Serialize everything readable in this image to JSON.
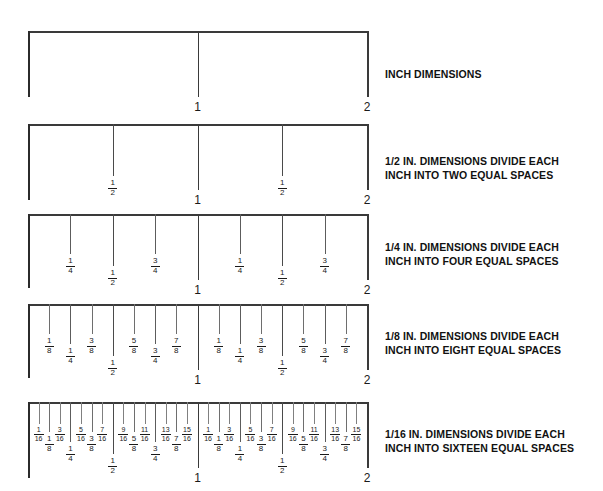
{
  "figure": {
    "background_color": "#ffffff",
    "line_color": "#3a3a3a",
    "text_color": "#1a1a1a"
  },
  "geometry": {
    "origin_x": 28,
    "inch_width": 169.5,
    "inches": 2,
    "rail_y": [
      31,
      124,
      214,
      304,
      402
    ],
    "endcap_bottom": [
      97,
      200,
      288,
      378,
      478
    ],
    "caption_x": 385,
    "caption_y": [
      68,
      155,
      241,
      330,
      428
    ],
    "tick_len": {
      "inch": 66,
      "half": 52,
      "quarter": 40,
      "eighth": 30,
      "sixteenth": 22
    },
    "label_offset": {
      "inch": 4,
      "half": 3,
      "quarter": 3,
      "eighth": 3,
      "sixteenth": 2
    }
  },
  "rulers": [
    {
      "id": "inch",
      "caption": "INCH DIMENSIONS",
      "inch_labels": [
        "1",
        "2"
      ],
      "fractions": []
    },
    {
      "id": "half",
      "caption": "1/2 IN. DIMENSIONS DIVIDE EACH\nINCH INTO TWO EQUAL SPACES",
      "inch_labels": [
        "1",
        "2"
      ],
      "fractions": [
        {
          "pos": 0.5,
          "num": "1",
          "den": "2",
          "tier": "half"
        },
        {
          "pos": 1.5,
          "num": "1",
          "den": "2",
          "tier": "half"
        }
      ]
    },
    {
      "id": "quarter",
      "caption": "1/4 IN. DIMENSIONS DIVIDE EACH\nINCH INTO FOUR EQUAL SPACES",
      "inch_labels": [
        "1",
        "2"
      ],
      "fractions": [
        {
          "pos": 0.25,
          "num": "1",
          "den": "4",
          "tier": "quarter"
        },
        {
          "pos": 0.5,
          "num": "1",
          "den": "2",
          "tier": "half"
        },
        {
          "pos": 0.75,
          "num": "3",
          "den": "4",
          "tier": "quarter"
        },
        {
          "pos": 1.25,
          "num": "1",
          "den": "4",
          "tier": "quarter"
        },
        {
          "pos": 1.5,
          "num": "1",
          "den": "2",
          "tier": "half"
        },
        {
          "pos": 1.75,
          "num": "3",
          "den": "4",
          "tier": "quarter"
        }
      ]
    },
    {
      "id": "eighth",
      "caption": "1/8 IN. DIMENSIONS DIVIDE EACH\nINCH INTO EIGHT EQUAL SPACES",
      "inch_labels": [
        "1",
        "2"
      ],
      "fractions": [
        {
          "pos": 0.125,
          "num": "1",
          "den": "8",
          "tier": "eighth"
        },
        {
          "pos": 0.25,
          "num": "1",
          "den": "4",
          "tier": "quarter"
        },
        {
          "pos": 0.375,
          "num": "3",
          "den": "8",
          "tier": "eighth"
        },
        {
          "pos": 0.5,
          "num": "1",
          "den": "2",
          "tier": "half"
        },
        {
          "pos": 0.625,
          "num": "5",
          "den": "8",
          "tier": "eighth"
        },
        {
          "pos": 0.75,
          "num": "3",
          "den": "4",
          "tier": "quarter"
        },
        {
          "pos": 0.875,
          "num": "7",
          "den": "8",
          "tier": "eighth"
        },
        {
          "pos": 1.125,
          "num": "1",
          "den": "8",
          "tier": "eighth"
        },
        {
          "pos": 1.25,
          "num": "1",
          "den": "4",
          "tier": "quarter"
        },
        {
          "pos": 1.375,
          "num": "3",
          "den": "8",
          "tier": "eighth"
        },
        {
          "pos": 1.5,
          "num": "1",
          "den": "2",
          "tier": "half"
        },
        {
          "pos": 1.625,
          "num": "5",
          "den": "8",
          "tier": "eighth"
        },
        {
          "pos": 1.75,
          "num": "3",
          "den": "4",
          "tier": "quarter"
        },
        {
          "pos": 1.875,
          "num": "7",
          "den": "8",
          "tier": "eighth"
        }
      ]
    },
    {
      "id": "sixteenth",
      "caption": "1/16 IN. DIMENSIONS DIVIDE EACH\nINCH INTO SIXTEEN EQUAL SPACES",
      "inch_labels": [
        "1",
        "2"
      ],
      "fractions": [
        {
          "pos": 0.0625,
          "num": "1",
          "den": "16",
          "tier": "sixteenth"
        },
        {
          "pos": 0.125,
          "num": "1",
          "den": "8",
          "tier": "eighth"
        },
        {
          "pos": 0.1875,
          "num": "3",
          "den": "16",
          "tier": "sixteenth"
        },
        {
          "pos": 0.25,
          "num": "1",
          "den": "4",
          "tier": "quarter"
        },
        {
          "pos": 0.3125,
          "num": "5",
          "den": "16",
          "tier": "sixteenth"
        },
        {
          "pos": 0.375,
          "num": "3",
          "den": "8",
          "tier": "eighth"
        },
        {
          "pos": 0.4375,
          "num": "7",
          "den": "16",
          "tier": "sixteenth"
        },
        {
          "pos": 0.5,
          "num": "1",
          "den": "2",
          "tier": "half"
        },
        {
          "pos": 0.5625,
          "num": "9",
          "den": "16",
          "tier": "sixteenth"
        },
        {
          "pos": 0.625,
          "num": "5",
          "den": "8",
          "tier": "eighth"
        },
        {
          "pos": 0.6875,
          "num": "11",
          "den": "16",
          "tier": "sixteenth"
        },
        {
          "pos": 0.75,
          "num": "3",
          "den": "4",
          "tier": "quarter"
        },
        {
          "pos": 0.8125,
          "num": "13",
          "den": "16",
          "tier": "sixteenth"
        },
        {
          "pos": 0.875,
          "num": "7",
          "den": "8",
          "tier": "eighth"
        },
        {
          "pos": 0.9375,
          "num": "15",
          "den": "16",
          "tier": "sixteenth"
        },
        {
          "pos": 1.0625,
          "num": "1",
          "den": "16",
          "tier": "sixteenth"
        },
        {
          "pos": 1.125,
          "num": "1",
          "den": "8",
          "tier": "eighth"
        },
        {
          "pos": 1.1875,
          "num": "3",
          "den": "16",
          "tier": "sixteenth"
        },
        {
          "pos": 1.25,
          "num": "1",
          "den": "4",
          "tier": "quarter"
        },
        {
          "pos": 1.3125,
          "num": "5",
          "den": "16",
          "tier": "sixteenth"
        },
        {
          "pos": 1.375,
          "num": "3",
          "den": "8",
          "tier": "eighth"
        },
        {
          "pos": 1.4375,
          "num": "7",
          "den": "16",
          "tier": "sixteenth"
        },
        {
          "pos": 1.5,
          "num": "1",
          "den": "2",
          "tier": "half"
        },
        {
          "pos": 1.5625,
          "num": "9",
          "den": "16",
          "tier": "sixteenth"
        },
        {
          "pos": 1.625,
          "num": "5",
          "den": "8",
          "tier": "eighth"
        },
        {
          "pos": 1.6875,
          "num": "11",
          "den": "16",
          "tier": "sixteenth"
        },
        {
          "pos": 1.75,
          "num": "3",
          "den": "4",
          "tier": "quarter"
        },
        {
          "pos": 1.8125,
          "num": "13",
          "den": "16",
          "tier": "sixteenth"
        },
        {
          "pos": 1.875,
          "num": "7",
          "den": "8",
          "tier": "eighth"
        },
        {
          "pos": 1.9375,
          "num": "15",
          "den": "16",
          "tier": "sixteenth"
        }
      ]
    }
  ]
}
